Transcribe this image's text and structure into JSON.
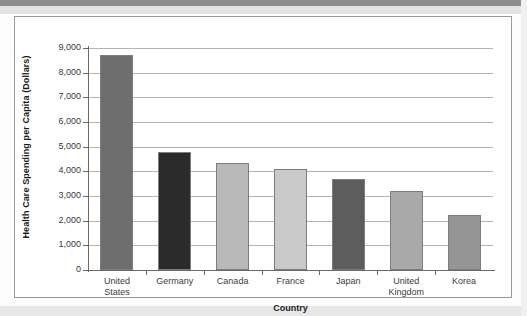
{
  "chart_data": {
    "type": "bar",
    "title": "",
    "xlabel": "Country",
    "ylabel": "Health Care Spending per Capita (Dollars)",
    "categories": [
      "United States",
      "Germany",
      "Canada",
      "France",
      "Japan",
      "United Kingdom",
      "Korea"
    ],
    "category_lines": [
      [
        "United",
        "States"
      ],
      [
        "Germany"
      ],
      [
        "Canada"
      ],
      [
        "France"
      ],
      [
        "Japan"
      ],
      [
        "United",
        "Kingdom"
      ],
      [
        "Korea"
      ]
    ],
    "values": [
      8700,
      4800,
      4350,
      4100,
      3700,
      3200,
      2250
    ],
    "bar_colors": [
      "#6e6e6e",
      "#2b2b2b",
      "#b9b9b9",
      "#c9c9c9",
      "#5d5d5d",
      "#a9a9a9",
      "#959595"
    ],
    "ylim": [
      0,
      9000
    ],
    "ytick_values": [
      0,
      1000,
      2000,
      3000,
      4000,
      5000,
      6000,
      7000,
      8000,
      9000
    ],
    "ytick_labels": [
      "0",
      "1,000",
      "2,000",
      "3,000",
      "4,000",
      "5,000",
      "6,000",
      "7,000",
      "8,000",
      "9,000"
    ],
    "grid": true,
    "grid_axis": "y",
    "legend": false,
    "legend_position": "none",
    "frame_color": "#9a9a9a",
    "gridline_color": "#b4b4b4",
    "axis_color": "#6a6a6a"
  }
}
